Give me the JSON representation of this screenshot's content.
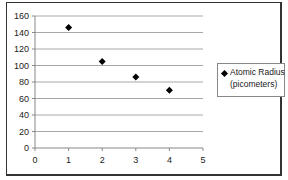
{
  "chart_data": {
    "type": "scatter",
    "title": "",
    "xlabel": "",
    "ylabel": "",
    "x": [
      1,
      2,
      3,
      4
    ],
    "series": [
      {
        "name": "Atomic Radius (picometers)",
        "values": [
          146,
          105,
          86,
          70
        ],
        "marker": "diamond",
        "color": "#000000"
      }
    ],
    "xlim": [
      0,
      5
    ],
    "ylim": [
      0,
      160
    ],
    "xticks": [
      "0",
      "1",
      "2",
      "3",
      "4",
      "5"
    ],
    "yticks": [
      "0",
      "20",
      "40",
      "60",
      "80",
      "100",
      "120",
      "140",
      "160"
    ],
    "grid": {
      "horizontal": true,
      "vertical": false
    },
    "legend_position": "right"
  },
  "legend": {
    "line1": "Atomic Radius",
    "line2": "(picometers)"
  }
}
